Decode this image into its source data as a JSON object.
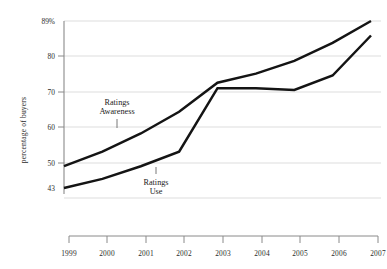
{
  "chart_data": {
    "type": "line",
    "title": "",
    "subtitle": "",
    "xlabel": "",
    "ylabel": "percentage of buyers",
    "categories": [
      "1999",
      "2000",
      "2001",
      "2002",
      "2003",
      "2004",
      "2005",
      "2006",
      "2007"
    ],
    "x": [
      1999,
      2000,
      2001,
      2002,
      2003,
      2004,
      2005,
      2006,
      2007
    ],
    "series": [
      {
        "name": "Ratings Awareness",
        "values": [
          49,
          53,
          58,
          64,
          72,
          74.5,
          78,
          83,
          89
        ],
        "color": "#141414"
      },
      {
        "name": "Ratings Use",
        "values": [
          43,
          45.5,
          49,
          53,
          70.5,
          70.5,
          70,
          74,
          85
        ],
        "color": "#141414"
      }
    ],
    "ylim": [
      43,
      89
    ],
    "yticks": [
      43,
      50,
      60,
      70,
      80,
      89
    ],
    "ytick_labels": [
      "43",
      "50",
      "60",
      "70",
      "80",
      "89%"
    ],
    "grid": true,
    "grid_axis": "y",
    "legend": "inline-annotations",
    "annotations": [
      {
        "name": "ratings-awareness-label",
        "line1": "Ratings",
        "line2": "Awareness",
        "target_series": "Ratings Awareness"
      },
      {
        "name": "ratings-use-label",
        "line1": "Ratings",
        "line2": "Use",
        "target_series": "Ratings Use"
      }
    ],
    "colors": {
      "line": "#141414",
      "grid": "#d9d9d9",
      "axis": "#8a8a8a",
      "text": "#2b2b2b",
      "background": "#ffffff"
    }
  },
  "axes": {
    "y_title": "percentage of buyers",
    "y_ticks": [
      {
        "label": "89%",
        "value": 89
      },
      {
        "label": "80",
        "value": 80
      },
      {
        "label": "70",
        "value": 70
      },
      {
        "label": "60",
        "value": 60
      },
      {
        "label": "50",
        "value": 50
      },
      {
        "label": "43",
        "value": 43
      }
    ],
    "x_ticks": [
      {
        "label": "1999"
      },
      {
        "label": "2000"
      },
      {
        "label": "2001"
      },
      {
        "label": "2002"
      },
      {
        "label": "2003"
      },
      {
        "label": "2004"
      },
      {
        "label": "2005"
      },
      {
        "label": "2006"
      },
      {
        "label": "2007"
      }
    ]
  },
  "annotations": {
    "awareness": {
      "line1": "Ratings",
      "line2": "Awareness"
    },
    "use": {
      "line1": "Ratings",
      "line2": "Use"
    }
  }
}
